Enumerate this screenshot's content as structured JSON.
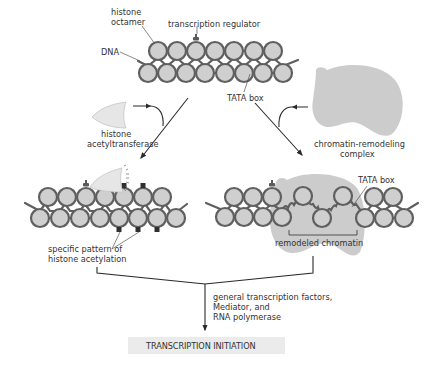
{
  "figure": {
    "type": "biology-diagram",
    "colors": {
      "nucleosome_fill": "#cfcfcf",
      "nucleosome_stroke": "#5f5f5f",
      "remodeling_complex": "#cccccc",
      "acetyltransferase": "#e6e6e6",
      "acetyl_mark": "#2f2f2f",
      "arrow": "#2a2a2a",
      "result_box": "#ebebeb",
      "text": "#333333"
    }
  },
  "top_panel": {
    "labels": {
      "histone_octamer_line1": "histone",
      "histone_octamer_line2": "octamer",
      "transcription_regulator": "transcription regulator",
      "dna": "DNA",
      "tata_box": "TATA box"
    }
  },
  "left_branch": {
    "enzyme_line1": "histone",
    "enzyme_line2": "acetyltransferase",
    "result_line1": "specific pattern of",
    "result_line2": "histone acetylation"
  },
  "right_branch": {
    "enzyme_line1": "chromatin-remodeling",
    "enzyme_line2": "complex",
    "tata_box": "TATA box",
    "result": "remodeled chromatin"
  },
  "merge": {
    "factors_line1": "general transcription factors,",
    "factors_line2": "Mediator, and",
    "factors_line3": "RNA polymerase"
  },
  "outcome": {
    "label": "TRANSCRIPTION INITIATION"
  }
}
